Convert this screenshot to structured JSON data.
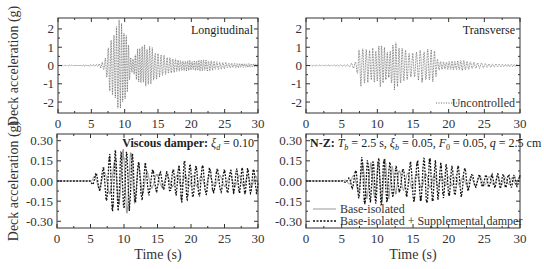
{
  "figure": {
    "ylabel": "Deck acceleration (g)",
    "xlabel": "Time (s)",
    "x_ticks": [
      "0",
      "5",
      "10",
      "15",
      "20",
      "25",
      "30"
    ]
  },
  "chart_data": [
    {
      "type": "line",
      "panel": "top-left",
      "title": "Longitudinal",
      "xlabel": "",
      "ylabel": "Deck acceleration (g)",
      "xlim": [
        0,
        30
      ],
      "ylim": [
        -2.6,
        2.6
      ],
      "y_ticks": [
        2,
        1,
        0,
        -1,
        -2
      ],
      "y_tick_labels": [
        "2",
        "1",
        "0",
        "-1",
        "-2"
      ],
      "grid": false,
      "series": [
        {
          "name": "Uncontrolled",
          "style": "dotted",
          "color": "#555555",
          "freq_hz": 2.6,
          "envelope_t": [
            0,
            6,
            7,
            7.8,
            8.5,
            9,
            9.5,
            10.5,
            11,
            11.5,
            12,
            13,
            14,
            15,
            16,
            17,
            18,
            20,
            22,
            24,
            26,
            28,
            30
          ],
          "envelope_a": [
            0.01,
            0.05,
            0.25,
            1.4,
            1.6,
            2.35,
            2.2,
            1.3,
            0.3,
            0.5,
            0.9,
            1.05,
            0.95,
            0.6,
            0.5,
            0.4,
            0.3,
            0.25,
            0.3,
            0.2,
            0.12,
            0.1,
            0.08
          ]
        }
      ]
    },
    {
      "type": "line",
      "panel": "top-right",
      "title": "Transverse",
      "xlabel": "",
      "ylabel": "",
      "xlim": [
        0,
        30
      ],
      "ylim": [
        -2.6,
        2.6
      ],
      "y_ticks": [
        2,
        1,
        0,
        -1,
        -2
      ],
      "y_tick_labels": [
        "2",
        "1",
        "0",
        "-1",
        "-2"
      ],
      "grid": false,
      "legend": {
        "position": "lower right",
        "entries": [
          "Uncontrolled"
        ]
      },
      "series": [
        {
          "name": "Uncontrolled",
          "style": "dotted",
          "color": "#555555",
          "freq_hz": 2.2,
          "envelope_t": [
            0,
            6,
            7,
            7.6,
            8,
            9,
            10,
            10.5,
            11.5,
            12.3,
            13,
            14,
            15,
            16,
            17,
            18,
            18.5,
            19,
            20,
            22,
            24,
            26,
            28,
            30
          ],
          "envelope_a": [
            0.01,
            0.05,
            0.2,
            1.05,
            0.9,
            0.8,
            0.9,
            1.2,
            0.6,
            1.25,
            1.1,
            0.8,
            0.6,
            0.85,
            0.85,
            0.8,
            0.3,
            0.2,
            0.2,
            0.25,
            0.15,
            0.08,
            0.06,
            0.05
          ]
        }
      ]
    },
    {
      "type": "line",
      "panel": "bottom-left",
      "annotation": {
        "bold": "Viscous damper:",
        "rest": " ξ",
        "sub": "d",
        "tail": " = 0.10"
      },
      "xlabel": "Time (s)",
      "ylabel": "Deck acceleration (g)",
      "xlim": [
        0,
        30
      ],
      "ylim": [
        -0.35,
        0.35
      ],
      "y_ticks": [
        0.3,
        0.15,
        0.0,
        -0.15,
        -0.3
      ],
      "y_tick_labels": [
        "0.30",
        "0.15",
        "0.00",
        "-0.15",
        "-0.30"
      ],
      "grid": false,
      "series": [
        {
          "name": "Base-isolated",
          "style": "solid",
          "color": "#999999",
          "freq_hz": 0.75,
          "envelope_t": [
            0,
            4.9,
            5.5,
            7,
            8,
            9,
            10.3,
            11,
            12,
            13,
            14,
            16,
            18,
            20,
            22,
            24,
            26,
            28,
            30
          ],
          "envelope_a": [
            0,
            0.0,
            0.03,
            0.06,
            0.1,
            0.15,
            0.24,
            0.2,
            0.12,
            0.08,
            0.05,
            0.04,
            0.04,
            0.04,
            0.04,
            0.04,
            0.04,
            0.04,
            0.04
          ]
        },
        {
          "name": "Base-isolated + Supplemental damper",
          "style": "dotted",
          "color": "#111111",
          "freq_hz": 1.05,
          "envelope_t": [
            0,
            4.9,
            5.5,
            7,
            8,
            8.5,
            9.5,
            10,
            11,
            12,
            13,
            14,
            16,
            18,
            18.7,
            20,
            22,
            24,
            26,
            28,
            30
          ],
          "envelope_a": [
            0,
            0.0,
            0.04,
            0.1,
            0.2,
            0.22,
            0.19,
            0.2,
            0.2,
            0.14,
            0.13,
            0.08,
            0.06,
            0.1,
            0.15,
            0.12,
            0.1,
            0.08,
            0.08,
            0.09,
            0.08
          ]
        }
      ]
    },
    {
      "type": "line",
      "panel": "bottom-right",
      "annotation": {
        "bold": "N-Z:",
        "rest": " T",
        "sub": "b",
        "tail": " = 2.5 s, ξ_b = 0.05, F_0 = 0.05, q = 2.5 cm"
      },
      "xlabel": "Time (s)",
      "ylabel": "",
      "xlim": [
        0,
        30
      ],
      "ylim": [
        -0.35,
        0.35
      ],
      "y_ticks": [
        0.3,
        0.15,
        0.0,
        -0.15,
        -0.3
      ],
      "y_tick_labels": [
        "0.30",
        "0.15",
        "0.00",
        "-0.15",
        "-0.30"
      ],
      "grid": false,
      "legend": {
        "position": "lower left",
        "entries": [
          "Base-isolated",
          "Base-isolated + Supplemental damper"
        ]
      },
      "series": [
        {
          "name": "Base-isolated",
          "style": "solid",
          "color": "#999999",
          "freq_hz": 0.9,
          "envelope_t": [
            0,
            5,
            6,
            7,
            8,
            9,
            10,
            11,
            12,
            13,
            14,
            15,
            17,
            19,
            21,
            23,
            25,
            27,
            30
          ],
          "envelope_a": [
            0,
            0.0,
            0.02,
            0.05,
            0.12,
            0.12,
            0.14,
            0.15,
            0.1,
            0.08,
            0.06,
            0.05,
            0.05,
            0.04,
            0.03,
            0.03,
            0.03,
            0.03,
            0.02
          ]
        },
        {
          "name": "Base-isolated + Supplemental damper",
          "style": "dotted",
          "color": "#111111",
          "freq_hz": 1.15,
          "envelope_t": [
            0,
            5,
            6,
            7,
            7.8,
            9,
            10.3,
            11,
            12,
            13,
            14,
            15,
            16,
            17,
            18,
            19,
            20,
            21,
            22,
            23,
            25,
            27,
            30
          ],
          "envelope_a": [
            0,
            0.0,
            0.02,
            0.08,
            0.17,
            0.14,
            0.17,
            0.15,
            0.12,
            0.08,
            0.1,
            0.15,
            0.14,
            0.17,
            0.14,
            0.12,
            0.11,
            0.1,
            0.11,
            0.05,
            0.04,
            0.05,
            0.04
          ]
        }
      ]
    }
  ],
  "annotations": {
    "top_left_title": "Longitudinal",
    "top_right_title": "Transverse",
    "legend_uncontrolled": "Uncontrolled",
    "bl_bold": "Viscous damper:",
    "bl_xi": "ξ",
    "bl_sub": "d",
    "bl_val": " = 0.10",
    "br_bold": "N-Z:",
    "br_T": "T",
    "br_T_sub": "b",
    "br_T_val": " = 2.5 s, ",
    "br_xi": "ξ",
    "br_xi_sub": "b",
    "br_xi_val": " = 0.05, ",
    "br_F": "F",
    "br_F_sub": "0",
    "br_F_val": " = 0.05, ",
    "br_q": "q",
    "br_q_val": " = 2.5 cm",
    "legend_base": "Base-isolated",
    "legend_damper": "Base-isolated + Supplemental damper"
  }
}
